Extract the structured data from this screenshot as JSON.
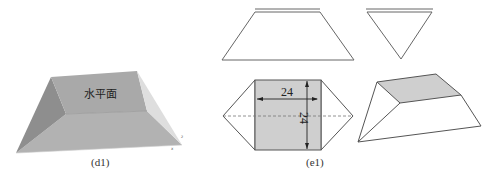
{
  "figure_d1": {
    "face_label": "水平面",
    "caption": "(d1)",
    "axis_marks": [
      "z",
      "x"
    ],
    "colors": {
      "top_face": "#a9a9a9",
      "left_face": "#8e8e8e",
      "front_face": "#b2b2b2",
      "right_face": "#dedede"
    }
  },
  "figure_e1": {
    "caption": "(e1)",
    "net_width_label": "24",
    "net_height_label": "24",
    "colors": {
      "shaded": "#cfcfcf",
      "outline": "#555555",
      "fold_line": "#777777"
    }
  }
}
